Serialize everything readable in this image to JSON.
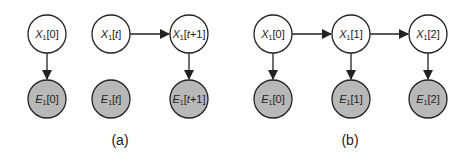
{
  "colors": {
    "hidden_fill": "#ffffff",
    "evidence_fill": "#b8b8b8",
    "stroke": "#222222"
  },
  "panels": [
    {
      "caption": "(a)",
      "nodes": [
        {
          "id": "a_x0",
          "var": "X",
          "sub": "1",
          "idx": "[0]",
          "italic_idx": false,
          "type": "hidden"
        },
        {
          "id": "a_e0",
          "var": "E",
          "sub": "1",
          "idx": "[0]",
          "italic_idx": false,
          "type": "evidence"
        },
        {
          "id": "a_xt",
          "var": "X",
          "sub": "1",
          "idx_pre": "[",
          "idx_it": "t",
          "idx_post": "]",
          "type": "hidden"
        },
        {
          "id": "a_et",
          "var": "E",
          "sub": "1",
          "idx_pre": "[",
          "idx_it": "t",
          "idx_post": "]",
          "type": "evidence"
        },
        {
          "id": "a_xt1",
          "var": "X",
          "sub": "1",
          "idx_pre": "[",
          "idx_it": "t",
          "idx_post": "+1]",
          "type": "hidden"
        },
        {
          "id": "a_et1",
          "var": "E",
          "sub": "1",
          "idx_pre": "[",
          "idx_it": "t",
          "idx_post": "+1]",
          "type": "evidence"
        }
      ],
      "edges": [
        [
          "X1[0]",
          "E1[0]"
        ],
        [
          "X1[t]",
          "X1[t+1]"
        ],
        [
          "X1[t+1]",
          "E1[t+1]"
        ]
      ]
    },
    {
      "caption": "(b)",
      "nodes": [
        {
          "id": "b_x0",
          "var": "X",
          "sub": "1",
          "idx": "[0]",
          "type": "hidden"
        },
        {
          "id": "b_e0",
          "var": "E",
          "sub": "1",
          "idx": "[0]",
          "type": "evidence"
        },
        {
          "id": "b_x1",
          "var": "X",
          "sub": "1",
          "idx": "[1]",
          "type": "hidden"
        },
        {
          "id": "b_e1",
          "var": "E",
          "sub": "1",
          "idx": "[1]",
          "type": "evidence"
        },
        {
          "id": "b_x2",
          "var": "X",
          "sub": "1",
          "idx": "[2]",
          "type": "hidden"
        },
        {
          "id": "b_e2",
          "var": "E",
          "sub": "1",
          "idx": "[2]",
          "type": "evidence"
        }
      ],
      "edges": [
        [
          "X1[0]",
          "X1[1]"
        ],
        [
          "X1[1]",
          "X1[2]"
        ],
        [
          "X1[0]",
          "E1[0]"
        ],
        [
          "X1[1]",
          "E1[1]"
        ],
        [
          "X1[2]",
          "E1[2]"
        ]
      ]
    }
  ]
}
